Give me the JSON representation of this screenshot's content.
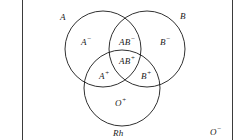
{
  "diagram": {
    "type": "venn-3-circle",
    "stroke_color": "#1a1a1a",
    "rule_color": "#3b3b3b",
    "background": "#ffffff",
    "circles": [
      {
        "id": "A",
        "label": "A",
        "cx": 103,
        "cy": 49,
        "r": 38
      },
      {
        "id": "B",
        "label": "B",
        "cx": 147,
        "cy": 49,
        "r": 38
      },
      {
        "id": "Rh",
        "label": "Rh",
        "cx": 122,
        "cy": 88,
        "r": 38
      }
    ],
    "circle_labels": [
      {
        "id": "label-A",
        "text": "A"
      },
      {
        "id": "label-B",
        "text": "B"
      },
      {
        "id": "label-Rh",
        "text": "Rh"
      }
    ],
    "regions": [
      {
        "id": "label-Aneg",
        "base": "A",
        "sign": "−",
        "text": "A"
      },
      {
        "id": "label-ABneg",
        "base": "AB",
        "sign": "−",
        "text": "AB"
      },
      {
        "id": "label-Bneg",
        "base": "B",
        "sign": "−",
        "text": "B"
      },
      {
        "id": "label-ABpos",
        "base": "AB",
        "sign": "+",
        "text": "AB"
      },
      {
        "id": "label-Apos",
        "base": "A",
        "sign": "+",
        "text": "A"
      },
      {
        "id": "label-Bpos",
        "base": "B",
        "sign": "+",
        "text": "B"
      },
      {
        "id": "label-Opos",
        "base": "O",
        "sign": "+",
        "text": "O"
      }
    ],
    "outside": {
      "id": "label-Oneg",
      "base": "O",
      "sign": "−",
      "text": "O"
    }
  }
}
